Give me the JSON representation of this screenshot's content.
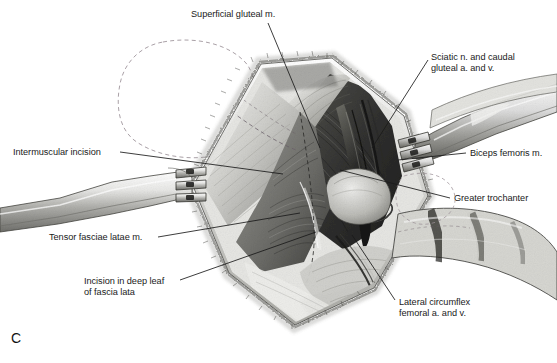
{
  "figure": {
    "letter": "C",
    "caption_letter_name": "figure-panel-letter",
    "background_color": "#ffffff",
    "ink_color": "#1a1a1a",
    "width": 557,
    "height": 363
  },
  "labels": [
    {
      "id": "superficial-gluteal",
      "text": "Superficial gluteal m.",
      "lines": [
        "Superficial gluteal m."
      ],
      "x": 191,
      "y": 9,
      "align": "left",
      "leader": {
        "x1": 268,
        "y1": 23,
        "x2": 320,
        "y2": 148
      }
    },
    {
      "id": "sciatic-caudal-gluteal",
      "text": "Sciatic n. and caudal gluteal a. and v.",
      "lines": [
        "Sciatic n. and caudal",
        "gluteal a. and v."
      ],
      "x": 431,
      "y": 52,
      "align": "left",
      "leader": {
        "x1": 428,
        "y1": 60,
        "x2": 372,
        "y2": 148
      }
    },
    {
      "id": "intermuscular-incision",
      "text": "Intermuscular incision",
      "lines": [
        "Intermuscular incision"
      ],
      "x": 13,
      "y": 147,
      "align": "left",
      "leader": {
        "x1": 120,
        "y1": 152,
        "x2": 283,
        "y2": 174
      }
    },
    {
      "id": "biceps-femoris",
      "text": "Biceps femoris m.",
      "lines": [
        "Biceps femoris m."
      ],
      "x": 470,
      "y": 148,
      "align": "left",
      "leader": {
        "x1": 466,
        "y1": 153,
        "x2": 398,
        "y2": 160
      }
    },
    {
      "id": "greater-trochanter",
      "text": "Greater trochanter",
      "lines": [
        "Greater trochanter"
      ],
      "x": 454,
      "y": 193,
      "align": "left",
      "leader": {
        "x1": 450,
        "y1": 198,
        "x2": 340,
        "y2": 170
      }
    },
    {
      "id": "tensor-fasciae-latae",
      "text": "Tensor fasciae latae m.",
      "lines": [
        "Tensor fasciae latae m."
      ],
      "x": 49,
      "y": 232,
      "align": "left",
      "leader": {
        "x1": 158,
        "y1": 237,
        "x2": 300,
        "y2": 213
      }
    },
    {
      "id": "incision-deep-leaf",
      "text": "Incision in deep leaf of fascia lata",
      "lines": [
        "Incision in deep leaf",
        "of fascia lata"
      ],
      "x": 84,
      "y": 276,
      "align": "left",
      "leader": {
        "x1": 180,
        "y1": 280,
        "x2": 316,
        "y2": 232
      }
    },
    {
      "id": "lateral-circumflex-femoral",
      "text": "Lateral circumflex femoral a. and v.",
      "lines": [
        "Lateral circumflex",
        "femoral a. and v."
      ],
      "x": 399,
      "y": 297,
      "align": "left",
      "leader": {
        "x1": 395,
        "y1": 300,
        "x2": 352,
        "y2": 235
      }
    }
  ],
  "anatomy_regions": [
    {
      "id": "skin-dashed-outline",
      "name": "dashed-skin-landmark-outline",
      "note": "Dashed hexagonal outline of underlying bone/landmark cranial to the wound"
    },
    {
      "id": "wound-margin",
      "name": "retracted-skin-wound-margin",
      "note": "Diamond shaped retracted skin and subcutaneous margin"
    },
    {
      "id": "retractor-left",
      "name": "gelpi-retractor-left",
      "note": "Three-pronged hand-held retractor entering from left"
    },
    {
      "id": "retractor-right",
      "name": "gelpi-retractor-right",
      "note": "Three-pronged hand-held retractor entering from right"
    },
    {
      "id": "muscle-tensor",
      "name": "tensor-fasciae-latae-muscle-belly"
    },
    {
      "id": "muscle-gluteal",
      "name": "superficial-gluteal-muscle-belly"
    },
    {
      "id": "muscle-biceps",
      "name": "biceps-femoris-muscle-belly"
    },
    {
      "id": "neurovascular",
      "name": "sciatic-nerve-and-gluteal-vessels"
    },
    {
      "id": "trochanter",
      "name": "greater-trochanter-bone"
    },
    {
      "id": "vessels-circumflex",
      "name": "lateral-circumflex-femoral-vessels"
    }
  ]
}
